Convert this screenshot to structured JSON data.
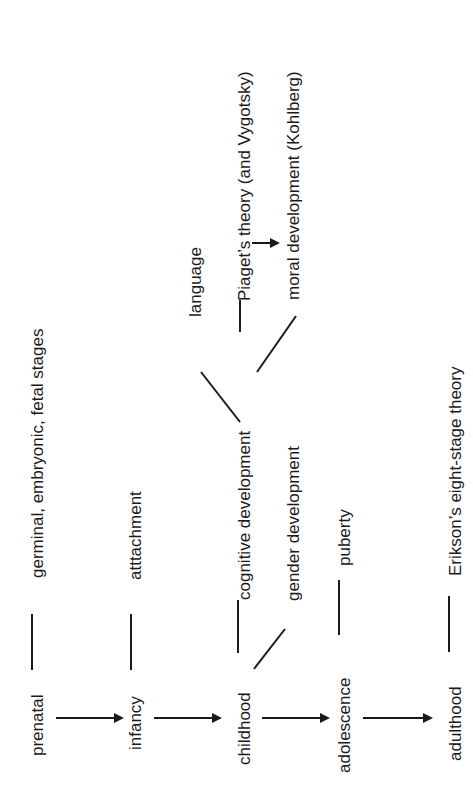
{
  "diagram": {
    "orientation": "rotated-90-ccw",
    "stages": [
      {
        "id": "prenatal",
        "label": "prenatal"
      },
      {
        "id": "infancy",
        "label": "infancy"
      },
      {
        "id": "childhood",
        "label": "childhood"
      },
      {
        "id": "adolescence",
        "label": "adolescence"
      },
      {
        "id": "adulthood",
        "label": "adulthood"
      }
    ],
    "topics": {
      "germinal": "germinal, embryonic, fetal stages",
      "attachment": "atttachment",
      "cognitive": "cognitive development",
      "gender": "gender development",
      "language": "language",
      "piaget": "Piaget’s theory (and Vygotsky)",
      "moral": "moral development (Kohlberg)",
      "puberty": "puberty",
      "erikson": "Erikson’s eight-stage theory"
    },
    "edges": [
      {
        "from": "prenatal",
        "to": "infancy",
        "type": "arrow"
      },
      {
        "from": "infancy",
        "to": "childhood",
        "type": "arrow"
      },
      {
        "from": "childhood",
        "to": "adolescence",
        "type": "arrow"
      },
      {
        "from": "adolescence",
        "to": "adulthood",
        "type": "arrow"
      },
      {
        "from": "prenatal",
        "to": "germinal",
        "type": "line"
      },
      {
        "from": "infancy",
        "to": "attachment",
        "type": "line"
      },
      {
        "from": "childhood",
        "to": "cognitive",
        "type": "line"
      },
      {
        "from": "childhood",
        "to": "gender",
        "type": "line"
      },
      {
        "from": "cognitive",
        "to": "language",
        "type": "line"
      },
      {
        "from": "cognitive",
        "to": "piaget",
        "type": "line"
      },
      {
        "from": "cognitive",
        "to": "moral",
        "type": "line"
      },
      {
        "from": "piaget",
        "to": "moral",
        "type": "arrow"
      },
      {
        "from": "adolescence",
        "to": "puberty",
        "type": "line"
      },
      {
        "from": "adulthood",
        "to": "erikson",
        "type": "line"
      }
    ],
    "colors": {
      "ink": "#1a1a1a",
      "background": "#ffffff"
    }
  }
}
